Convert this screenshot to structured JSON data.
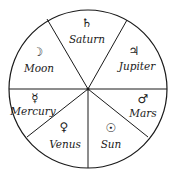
{
  "diagram": {
    "type": "planetary-wheel",
    "sectors": [
      {
        "name": "Saturn",
        "symbol": "♄"
      },
      {
        "name": "Jupiter",
        "symbol": "♃"
      },
      {
        "name": "Mars",
        "symbol": "♂"
      },
      {
        "name": "Sun",
        "symbol": "☉"
      },
      {
        "name": "Venus",
        "symbol": "♀"
      },
      {
        "name": "Mercury",
        "symbol": "☿"
      },
      {
        "name": "Moon",
        "symbol": "☽"
      }
    ],
    "colors": {
      "stroke": "#1a1a1a",
      "background": "#ffffff"
    }
  }
}
